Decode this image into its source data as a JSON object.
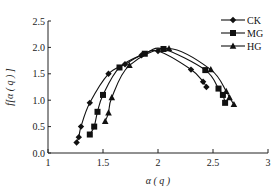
{
  "chart_data": {
    "type": "line",
    "title": "",
    "xlabel": "α ( q )",
    "ylabel": "f[α ( q ) ]",
    "xlim": [
      1,
      3
    ],
    "ylim": [
      0,
      2.5
    ],
    "xticks": [
      "1",
      "1.5",
      "2",
      "2.5",
      "3"
    ],
    "yticks": [
      "0.0",
      "0.5",
      "1.0",
      "1.5",
      "2.0",
      "2.5"
    ],
    "grid": false,
    "legend_position": "upper right",
    "series": [
      {
        "name": "CK",
        "marker": "diamond",
        "x": [
          1.26,
          1.28,
          1.3,
          1.38,
          1.55,
          1.7,
          1.85,
          2.0,
          2.3,
          2.41,
          2.44
        ],
        "y": [
          0.2,
          0.3,
          0.5,
          0.95,
          1.5,
          1.68,
          1.85,
          1.93,
          1.58,
          1.35,
          1.25
        ]
      },
      {
        "name": "MG",
        "marker": "square",
        "x": [
          1.38,
          1.42,
          1.45,
          1.5,
          1.65,
          1.88,
          2.05,
          2.43,
          2.55,
          2.59,
          2.61
        ],
        "y": [
          0.35,
          0.5,
          0.78,
          1.1,
          1.62,
          1.88,
          1.97,
          1.57,
          1.22,
          1.1,
          0.95
        ]
      },
      {
        "name": "HG",
        "marker": "triangle",
        "x": [
          1.52,
          1.55,
          1.58,
          1.74,
          2.1,
          2.48,
          2.62,
          2.65,
          2.69
        ],
        "y": [
          0.6,
          0.76,
          1.05,
          1.66,
          1.98,
          1.58,
          1.17,
          1.05,
          0.92
        ]
      }
    ]
  },
  "colors": {
    "line": "#111111",
    "axis": "#222222"
  }
}
